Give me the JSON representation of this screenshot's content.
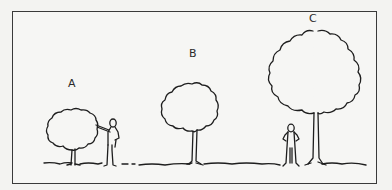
{
  "figure": {
    "type": "illustration",
    "trees": [
      {
        "label": "A",
        "size": "small",
        "has_person": true,
        "person_pose": "reaching toward canopy"
      },
      {
        "label": "B",
        "size": "medium",
        "has_person": false
      },
      {
        "label": "C",
        "size": "large",
        "has_person": true,
        "person_pose": "hands on hips, standing under canopy"
      }
    ]
  },
  "colors": {
    "ink": "#1e1e1e",
    "paper": "#f6f6f4",
    "border": "#3a3a3a"
  }
}
